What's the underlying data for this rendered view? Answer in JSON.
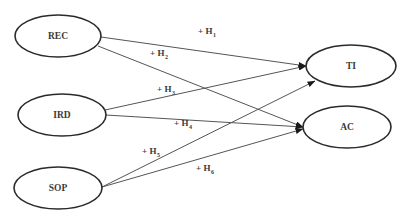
{
  "diagram": {
    "type": "path-model",
    "nodes": [
      {
        "id": "REC",
        "label": "REC",
        "cx": 58,
        "cy": 36,
        "rx": 43,
        "ry": 21
      },
      {
        "id": "IRD",
        "label": "IRD",
        "cx": 62,
        "cy": 115,
        "rx": 44,
        "ry": 21
      },
      {
        "id": "SOP",
        "label": "SOP",
        "cx": 58,
        "cy": 188,
        "rx": 44,
        "ry": 21
      },
      {
        "id": "TI",
        "label": "TI",
        "cx": 351,
        "cy": 66,
        "rx": 45,
        "ry": 21
      },
      {
        "id": "AC",
        "label": "AC",
        "cx": 347,
        "cy": 127,
        "rx": 44,
        "ry": 21
      }
    ],
    "edges": [
      {
        "id": "H1",
        "from": "REC",
        "to": "TI",
        "sign": "+",
        "hyp": "H",
        "sub": "1",
        "x1": 101,
        "y1": 37,
        "x2": 306,
        "y2": 66,
        "lx": 198,
        "ly": 34
      },
      {
        "id": "H2",
        "from": "REC",
        "to": "AC",
        "sign": "+",
        "hyp": "H",
        "sub": "2",
        "x1": 98,
        "y1": 46,
        "x2": 303,
        "y2": 127,
        "lx": 150,
        "ly": 56
      },
      {
        "id": "H3",
        "from": "IRD",
        "to": "TI",
        "sign": "+",
        "hyp": "H",
        "sub": "3",
        "x1": 105,
        "y1": 110,
        "x2": 306,
        "y2": 66,
        "lx": 157,
        "ly": 92
      },
      {
        "id": "H4",
        "from": "IRD",
        "to": "AC",
        "sign": "+",
        "hyp": "H",
        "sub": "4",
        "x1": 106,
        "y1": 115,
        "x2": 303,
        "y2": 127,
        "lx": 174,
        "ly": 126
      },
      {
        "id": "H5",
        "from": "SOP",
        "to": "TI",
        "sign": "+",
        "hyp": "H",
        "sub": "5",
        "x1": 102,
        "y1": 187,
        "x2": 315,
        "y2": 81,
        "lx": 142,
        "ly": 154
      },
      {
        "id": "H6",
        "from": "SOP",
        "to": "AC",
        "sign": "+",
        "hyp": "H",
        "sub": "6",
        "x1": 102,
        "y1": 187,
        "x2": 303,
        "y2": 129,
        "lx": 196,
        "ly": 171
      }
    ],
    "colors": {
      "background": "#ffffff",
      "node_stroke": "#2a2a2a",
      "edge_stroke": "#555555",
      "text": "#3a3a3a"
    }
  }
}
